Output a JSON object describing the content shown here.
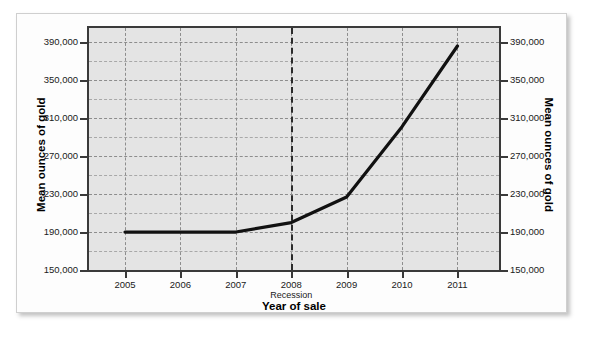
{
  "chart_data": {
    "type": "line",
    "title": "",
    "xlabel": "Year of sale",
    "ylabel": "Mean ounces of gold",
    "ylabel_right": "Mean ounces of gold",
    "x": [
      2005,
      2006,
      2007,
      2008,
      2009,
      2010,
      2011
    ],
    "categories": [
      "2005",
      "2006",
      "2007",
      "2008",
      "2009",
      "2010",
      "2011"
    ],
    "values": [
      190000,
      190000,
      190000,
      200000,
      227000,
      301000,
      386000
    ],
    "series": [
      {
        "name": "Mean ounces of gold",
        "values": [
          190000,
          190000,
          190000,
          200000,
          227000,
          301000,
          386000
        ],
        "color": "#111111"
      }
    ],
    "xlim": [
      2004.35,
      2011.75
    ],
    "ylim": [
      150000,
      405000
    ],
    "y_major_ticks": [
      150000,
      190000,
      230000,
      270000,
      310000,
      350000,
      390000
    ],
    "y_tick_labels": [
      "150,000",
      "190,000",
      "230,000",
      "270,000",
      "310,000",
      "350,000",
      "390,000"
    ],
    "y_minor_step": 20000,
    "grid": true,
    "grid_style": "dashed",
    "legend": "none",
    "plot_background": "#e4e4e4",
    "annotations": [
      {
        "name": "recession-marker",
        "label": "Recession",
        "x": 2008,
        "style": "dashed-vertical-line"
      }
    ]
  },
  "card": {
    "background": "#fdfdfd",
    "border_color": "#cfcfcf"
  }
}
